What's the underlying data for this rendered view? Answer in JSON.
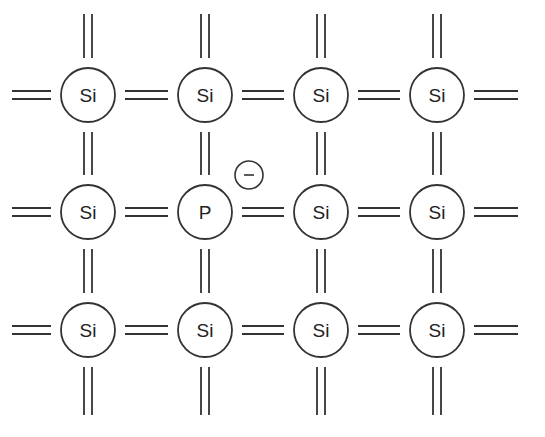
{
  "diagram": {
    "stroke_color": "#333333",
    "columns_x": [
      88,
      205,
      321,
      437
    ],
    "rows_y": [
      95,
      212,
      330
    ],
    "atom_radius": 27,
    "atoms": [
      [
        "Si",
        "Si",
        "Si",
        "Si"
      ],
      [
        "Si",
        "P",
        "Si",
        "Si"
      ],
      [
        "Si",
        "Si",
        "Si",
        "Si"
      ]
    ],
    "free_electron": {
      "symbol": "−",
      "x": 249,
      "y": 175,
      "radius": 14
    }
  }
}
